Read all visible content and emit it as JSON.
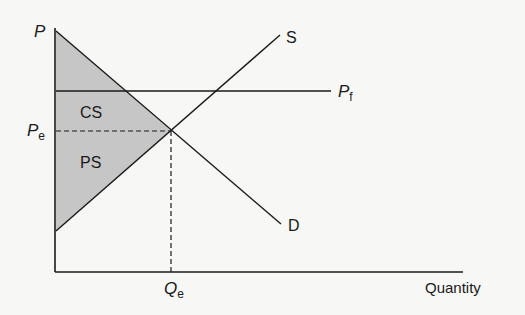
{
  "diagram": {
    "type": "supply-demand",
    "labels": {
      "price_axis": "P",
      "quantity_axis": "Quantity",
      "supply": "S",
      "demand": "D",
      "world_price": "P",
      "world_price_sub": "f",
      "eq_price": "P",
      "eq_price_sub": "e",
      "eq_quantity": "Q",
      "eq_quantity_sub": "e",
      "consumer_surplus": "CS",
      "producer_surplus": "PS"
    },
    "colors": {
      "background": "#f7f7f5",
      "line": "#1a1a1a",
      "shade": "#c6c6c6"
    },
    "geometry": {
      "origin": [
        55,
        272
      ],
      "y_axis_top": 28,
      "x_axis_end": 463,
      "demand": [
        [
          56,
          31
        ],
        [
          281,
          224
        ]
      ],
      "supply": [
        [
          56,
          231
        ],
        [
          280,
          35
        ]
      ],
      "equilibrium": [
        171,
        131
      ],
      "world_price_y": 91,
      "world_price_x_end": 331
    }
  }
}
